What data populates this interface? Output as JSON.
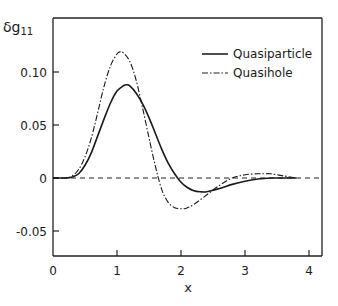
{
  "chart_data": {
    "type": "line",
    "title": "",
    "xlabel": "x",
    "ylabel": "δg11",
    "ylabel_main": "δg",
    "ylabel_sub": "11",
    "xlim": [
      0,
      4.2
    ],
    "ylim": [
      -0.074,
      0.15
    ],
    "xticks": [
      0,
      1,
      2,
      3,
      4
    ],
    "xtick_labels": [
      "0",
      "1",
      "2",
      "3",
      "4"
    ],
    "yticks": [
      0.1,
      0.05,
      0,
      -0.05
    ],
    "ytick_labels": [
      "0.10",
      "0.05",
      "0",
      "-0.05"
    ],
    "grid": false,
    "legend_position": "upper right",
    "reference_line": {
      "y": 0,
      "style": "dashed"
    },
    "series": [
      {
        "name": "Quasiparticle",
        "style": "solid",
        "x": [
          0.0,
          0.2,
          0.3,
          0.4,
          0.5,
          0.6,
          0.7,
          0.8,
          0.9,
          1.0,
          1.1,
          1.15,
          1.2,
          1.3,
          1.4,
          1.5,
          1.6,
          1.7,
          1.8,
          1.9,
          2.0,
          2.1,
          2.2,
          2.3,
          2.4,
          2.6,
          2.8,
          3.0,
          3.2,
          3.4,
          3.6,
          3.8
        ],
        "values": [
          0.0,
          0.0,
          0.001,
          0.004,
          0.012,
          0.024,
          0.04,
          0.056,
          0.071,
          0.082,
          0.087,
          0.088,
          0.087,
          0.08,
          0.07,
          0.057,
          0.042,
          0.027,
          0.014,
          0.004,
          -0.004,
          -0.009,
          -0.012,
          -0.013,
          -0.013,
          -0.01,
          -0.006,
          -0.003,
          -0.001,
          0.0,
          0.0,
          0.0
        ]
      },
      {
        "name": "Quasihole",
        "style": "dash-dot",
        "x": [
          0.0,
          0.2,
          0.3,
          0.4,
          0.5,
          0.6,
          0.7,
          0.8,
          0.9,
          1.0,
          1.05,
          1.1,
          1.2,
          1.3,
          1.4,
          1.5,
          1.6,
          1.7,
          1.8,
          1.9,
          2.0,
          2.05,
          2.1,
          2.2,
          2.4,
          2.6,
          2.8,
          3.0,
          3.2,
          3.3,
          3.4,
          3.6,
          3.8
        ],
        "values": [
          0.0,
          0.0,
          0.002,
          0.008,
          0.02,
          0.038,
          0.062,
          0.087,
          0.106,
          0.117,
          0.119,
          0.118,
          0.11,
          0.092,
          0.066,
          0.038,
          0.011,
          -0.011,
          -0.023,
          -0.028,
          -0.029,
          -0.029,
          -0.028,
          -0.025,
          -0.016,
          -0.007,
          0.0,
          0.003,
          0.004,
          0.004,
          0.004,
          0.002,
          0.0
        ]
      }
    ]
  }
}
